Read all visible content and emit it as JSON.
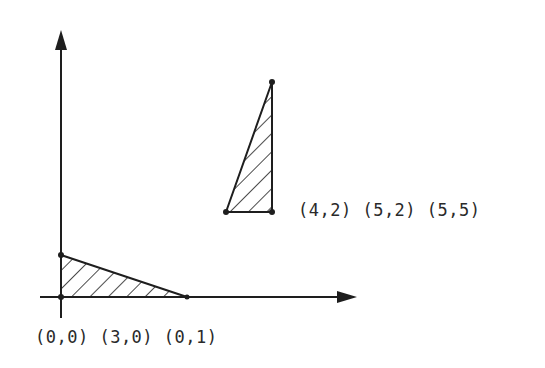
{
  "diagram": {
    "type": "coordinate-plane",
    "axes": {
      "x_axis": {
        "arrow": true
      },
      "y_axis": {
        "arrow": true
      }
    },
    "triangles": [
      {
        "name": "original-triangle",
        "vertices": [
          [
            0,
            0
          ],
          [
            3,
            0
          ],
          [
            0,
            1
          ]
        ],
        "hatched": true,
        "label": "(0,0) (3,0) (0,1)"
      },
      {
        "name": "transformed-triangle",
        "vertices": [
          [
            4,
            2
          ],
          [
            5,
            2
          ],
          [
            5,
            5
          ]
        ],
        "hatched": true,
        "label": "(4,2) (5,2) (5,5)"
      }
    ],
    "colors": {
      "ink": "#1e1e1e",
      "background": "#ffffff"
    }
  }
}
